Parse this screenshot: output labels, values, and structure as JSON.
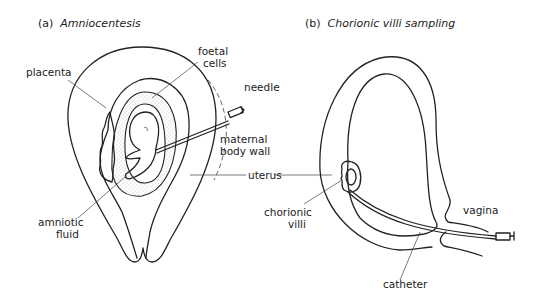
{
  "panels": [
    {
      "id": "a",
      "prefix": "(a)",
      "title": "Amniocentesis",
      "labels": {
        "placenta": "placenta",
        "foetal_cells_1": "foetal",
        "foetal_cells_2": "cells",
        "needle": "needle",
        "maternal_1": "maternal",
        "maternal_2": "body wall",
        "amniotic_1": "amniotic",
        "amniotic_2": "fluid"
      }
    },
    {
      "id": "b",
      "prefix": "(b)",
      "title": "Chorionic villi sampling",
      "labels": {
        "chorionic_1": "chorionic",
        "chorionic_2": "villi",
        "vagina": "vagina",
        "catheter": "catheter"
      }
    }
  ],
  "shared_labels": {
    "uterus": "uterus"
  },
  "colors": {
    "line": "#222222",
    "background": "#ffffff",
    "stipple": "#888888"
  }
}
